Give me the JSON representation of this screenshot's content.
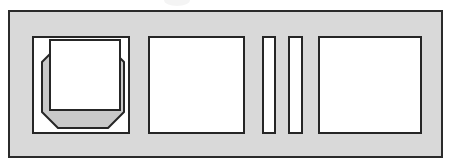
{
  "figure": {
    "canvas": {
      "width": 451,
      "height": 158
    },
    "colors": {
      "page_background": "#ffffff",
      "frame_fill": "#d9d9d9",
      "frame_stroke": "#2b2b2b",
      "panel_fill": "#ffffff",
      "panel_stroke": "#262626",
      "bevel_shade": "#c9c9c9",
      "artifact": "#f2f2f2"
    },
    "artifact": {
      "name": "scan-smudge",
      "x": 164,
      "y": -6,
      "width": 26,
      "height": 12
    },
    "frame": {
      "label": "outer-frame",
      "x": 8,
      "y": 10,
      "width": 435,
      "height": 148,
      "border_width": 2
    },
    "panels": [
      {
        "id": "panel-octagon",
        "label": "beveled octagon panel",
        "x": 32,
        "y": 36,
        "width": 98,
        "height": 98,
        "border_width": 2,
        "graphic": {
          "type": "octagon-with-offset-square",
          "octagon_points": "8,24 24,8 74,8 90,24 90,74 74,90 24,90 8,74",
          "inner_square": {
            "x": 16,
            "y": 2,
            "width": 70,
            "height": 70
          },
          "stroke_width": 2
        }
      },
      {
        "id": "panel-plain-left",
        "label": "plain square panel",
        "x": 148,
        "y": 36,
        "width": 97,
        "height": 98,
        "border_width": 2
      },
      {
        "id": "bar-left",
        "label": "narrow vertical bar",
        "x": 262,
        "y": 36,
        "width": 14,
        "height": 98,
        "border_width": 2
      },
      {
        "id": "bar-right",
        "label": "narrow vertical bar",
        "x": 288,
        "y": 36,
        "width": 15,
        "height": 98,
        "border_width": 2
      },
      {
        "id": "panel-plain-right",
        "label": "plain square panel",
        "x": 318,
        "y": 36,
        "width": 104,
        "height": 98,
        "border_width": 2
      }
    ]
  }
}
